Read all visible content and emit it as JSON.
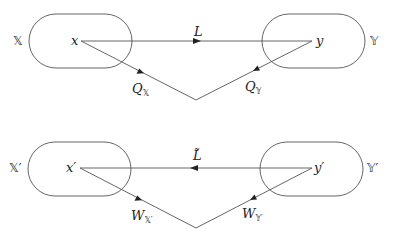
{
  "diagram": {
    "top": {
      "left_set": "𝕏",
      "right_set": "𝕐",
      "left_point": "x",
      "right_point": "y",
      "horizontal_arrow_label": "L",
      "left_diag_label": "Q",
      "left_diag_sub": "𝕏",
      "right_diag_label": "Q",
      "right_diag_sub": "𝕐"
    },
    "bottom": {
      "left_set": "𝕏′",
      "right_set": "𝕐′",
      "left_point": "x′",
      "right_point": "y′",
      "horizontal_arrow_label": "L̃",
      "left_diag_label": "W",
      "left_diag_sub": "𝕏′",
      "right_diag_label": "W",
      "right_diag_sub": "𝕐′"
    },
    "colors": {
      "stroke": "#333333",
      "text": "#222222"
    }
  }
}
